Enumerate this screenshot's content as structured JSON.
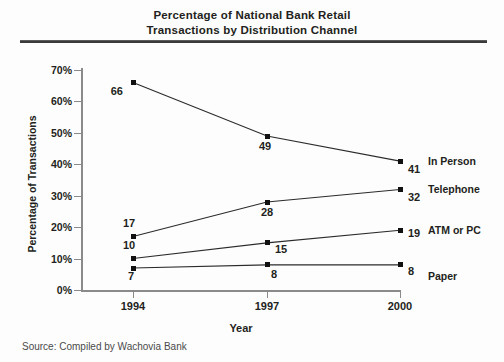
{
  "chart_data": {
    "type": "line",
    "title": "Percentage of National Bank Retail Transactions by Distribution Channel",
    "title_lines": [
      "Percentage of National Bank Retail",
      "Transactions by Distribution Channel"
    ],
    "xlabel": "Year",
    "ylabel": "Percentage of Transactions",
    "categories": [
      "1994",
      "1997",
      "2000"
    ],
    "x": [
      1994,
      1997,
      2000
    ],
    "ylim": [
      0,
      70
    ],
    "y_ticks": [
      0,
      10,
      20,
      30,
      40,
      50,
      60,
      70
    ],
    "y_tick_labels": [
      "0%",
      "10%",
      "20%",
      "30%",
      "40%",
      "50%",
      "60%",
      "70%"
    ],
    "grid": false,
    "legend_position": "right-of-plot-at-line-end",
    "marker": "square",
    "series": [
      {
        "name": "In Person",
        "values": [
          66,
          49,
          41
        ],
        "labels": [
          "66",
          "49",
          "41"
        ]
      },
      {
        "name": "Telephone",
        "values": [
          17,
          28,
          32
        ],
        "labels": [
          "17",
          "28",
          "32"
        ]
      },
      {
        "name": "ATM or PC",
        "values": [
          10,
          15,
          19
        ],
        "labels": [
          "10",
          "15",
          "19"
        ]
      },
      {
        "name": "Paper",
        "values": [
          7,
          8,
          8
        ],
        "labels": [
          "7",
          "8",
          "8"
        ]
      }
    ],
    "source": "Source: Compiled by Wachovia Bank",
    "colors": {
      "line": "#2b2b2b",
      "marker": "#111111",
      "text": "#231f20",
      "axis": "#8a8a8a",
      "rule": "#3a3a3a",
      "background": "#fdfdfd"
    }
  }
}
